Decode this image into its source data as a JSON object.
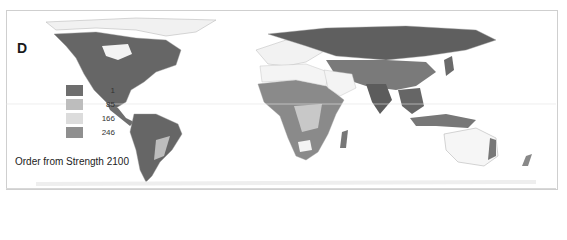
{
  "figure": {
    "panel_letter": "D",
    "caption": "Order from Strength 2100",
    "legend": {
      "items": [
        {
          "label": "1",
          "color": "#6e6e6e"
        },
        {
          "label": "85",
          "color": "#bdbdbd"
        },
        {
          "label": "166",
          "color": "#dcdcdc"
        },
        {
          "label": "246",
          "color": "#8f8f8f"
        }
      ]
    },
    "colors": {
      "land_dark": "#5f5f5f",
      "land_mid": "#8a8a8a",
      "land_light": "#c8c8c8",
      "land_white": "#f4f4f4",
      "border": "#b0b0b0",
      "ocean": "#ffffff"
    }
  }
}
